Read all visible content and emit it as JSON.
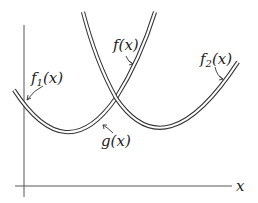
{
  "diagram": {
    "type": "function-envelope",
    "axis": {
      "x_label": "x"
    },
    "curves": [
      {
        "id": "f1",
        "label": "f",
        "subscript": "1",
        "arg": "(x)",
        "shape": "parabola, minimum left"
      },
      {
        "id": "f2",
        "label": "f",
        "subscript": "2",
        "arg": "(x)",
        "shape": "parabola, minimum right"
      },
      {
        "id": "f",
        "label": "f(x)",
        "shape": "upper branch of f1 beyond crossing"
      },
      {
        "id": "g",
        "label": "g(x)",
        "shape": "lower envelope min(f1, f2)"
      }
    ],
    "labels": {
      "f": "f(x)",
      "f1_main": "f",
      "f1_sub": "1",
      "f1_arg": "(x)",
      "f2_main": "f",
      "f2_sub": "2",
      "f2_arg": "(x)",
      "g": "g(x)",
      "x": "x"
    }
  }
}
